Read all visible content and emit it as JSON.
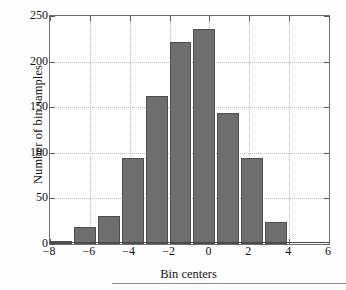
{
  "chart_data": {
    "type": "bar",
    "title": "",
    "xlabel": "Bin centers",
    "ylabel": "Number of bin samples",
    "xlim": [
      -8,
      6
    ],
    "ylim": [
      0,
      250
    ],
    "xticks": [
      -8,
      -6,
      -4,
      -2,
      0,
      2,
      4,
      6
    ],
    "xtick_labels": [
      "−8",
      "−6",
      "−4",
      "−2",
      "0",
      "2",
      "4",
      "6"
    ],
    "yticks": [
      0,
      50,
      100,
      150,
      200,
      250
    ],
    "ytick_labels": [
      "0",
      "50",
      "100",
      "150",
      "200",
      "250"
    ],
    "grid": true,
    "legend": false,
    "bar_color": "#6e6e6e",
    "bar_edge_color": "#4e4e4e",
    "bin_width": 1.2,
    "categories": [
      -7.4,
      -6.2,
      -5.0,
      -3.8,
      -2.6,
      -1.4,
      -0.2,
      1.0,
      2.2,
      3.4,
      4.6
    ],
    "values": [
      3,
      19,
      31,
      94,
      162,
      222,
      236,
      144,
      94,
      24,
      0
    ],
    "bars": [
      {
        "center": -7.4,
        "value": 3
      },
      {
        "center": -6.2,
        "value": 19
      },
      {
        "center": -5.0,
        "value": 31
      },
      {
        "center": -3.8,
        "value": 94
      },
      {
        "center": -2.6,
        "value": 162
      },
      {
        "center": -1.4,
        "value": 222
      },
      {
        "center": -0.2,
        "value": 236
      },
      {
        "center": 1.0,
        "value": 144
      },
      {
        "center": 2.2,
        "value": 94
      },
      {
        "center": 3.4,
        "value": 24
      }
    ]
  }
}
